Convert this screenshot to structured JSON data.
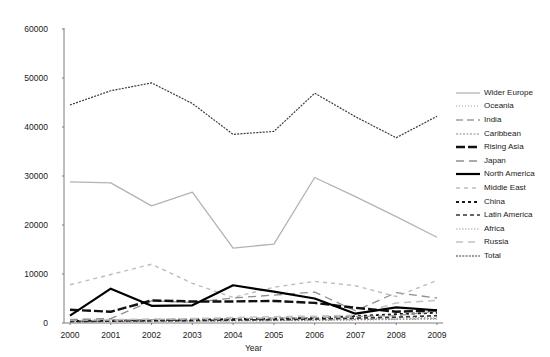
{
  "title": "",
  "axis": {
    "x_title": "Year",
    "y_ticks": [
      "0",
      "10000",
      "20000",
      "30000",
      "40000",
      "50000",
      "60000"
    ],
    "x_ticks": [
      "2000",
      "2001",
      "2002",
      "2003",
      "2004",
      "2005",
      "2006",
      "2007",
      "2008",
      "2009"
    ]
  },
  "legend": {
    "items": [
      {
        "label": "Wider Europe",
        "color": "#b3b3b3",
        "width": 1.3,
        "dash": "none"
      },
      {
        "label": "Oceania",
        "color": "#999999",
        "width": 1.1,
        "dash": "1,2"
      },
      {
        "label": "India",
        "color": "#9e9e9e",
        "width": 1.3,
        "dash": "7,4"
      },
      {
        "label": "Caribbean",
        "color": "#8a8a8a",
        "width": 1.1,
        "dash": "2,1.5"
      },
      {
        "label": "Rising Asia",
        "color": "#111111",
        "width": 2.4,
        "dash": "9,3"
      },
      {
        "label": "Japan",
        "color": "#8f8f8f",
        "width": 1.3,
        "dash": "8,5"
      },
      {
        "label": "North America",
        "color": "#000000",
        "width": 2.2,
        "dash": "none"
      },
      {
        "label": "Middle East",
        "color": "#bdbdbd",
        "width": 1.4,
        "dash": "4,4"
      },
      {
        "label": "China",
        "color": "#1a1a1a",
        "width": 1.9,
        "dash": "3,3"
      },
      {
        "label": "Latin America",
        "color": "#333333",
        "width": 1.7,
        "dash": "4,3"
      },
      {
        "label": "Africa",
        "color": "#a8a8a8",
        "width": 1.1,
        "dash": "1.5,1.5"
      },
      {
        "label": "Russia",
        "color": "#c2c2c2",
        "width": 1.5,
        "dash": "7,5"
      },
      {
        "label": "Total",
        "color": "#3d3d3d",
        "width": 1.2,
        "dash": "2,1.2"
      }
    ]
  },
  "chart_data": {
    "type": "line",
    "title": "",
    "xlabel": "Year",
    "ylabel": "",
    "grid": false,
    "legend_position": "right",
    "xlim": [
      2000,
      2009
    ],
    "ylim": [
      0,
      60000
    ],
    "x": [
      2000,
      2001,
      2002,
      2003,
      2004,
      2005,
      2006,
      2007,
      2008,
      2009
    ],
    "series": [
      {
        "name": "Total",
        "values": [
          44500,
          47400,
          49000,
          44800,
          38500,
          39100,
          46900,
          42100,
          37800,
          42200
        ]
      },
      {
        "name": "Wider Europe",
        "values": [
          28800,
          28600,
          23900,
          26700,
          15300,
          16100,
          29700,
          25800,
          21700,
          17500
        ]
      },
      {
        "name": "North America",
        "values": [
          1500,
          7000,
          3500,
          3600,
          7700,
          6400,
          5000,
          1900,
          3200,
          2600
        ]
      },
      {
        "name": "Middle East",
        "values": [
          7800,
          9900,
          12000,
          8100,
          5200,
          7300,
          8500,
          7600,
          5400,
          8700
        ]
      },
      {
        "name": "Rising Asia",
        "values": [
          2700,
          2300,
          4600,
          4400,
          4400,
          4500,
          4100,
          3100,
          2300,
          2600
        ]
      },
      {
        "name": "Japan",
        "values": [
          700,
          900,
          4500,
          4200,
          5100,
          5700,
          6300,
          2500,
          6200,
          5100
        ]
      },
      {
        "name": "Russia",
        "values": [
          700,
          700,
          800,
          900,
          1100,
          1300,
          1400,
          1600,
          4100,
          4600
        ]
      },
      {
        "name": "India",
        "values": [
          500,
          600,
          700,
          800,
          900,
          1000,
          1100,
          1300,
          1500,
          2400
        ]
      },
      {
        "name": "China",
        "values": [
          400,
          500,
          600,
          700,
          800,
          900,
          1000,
          1400,
          1800,
          2100
        ]
      },
      {
        "name": "Latin America",
        "values": [
          300,
          400,
          450,
          500,
          600,
          700,
          800,
          1000,
          1200,
          1500
        ]
      },
      {
        "name": "Africa",
        "values": [
          350,
          400,
          500,
          550,
          650,
          700,
          800,
          900,
          1000,
          1200
        ]
      },
      {
        "name": "Caribbean",
        "values": [
          250,
          300,
          350,
          400,
          450,
          500,
          600,
          700,
          800,
          900
        ]
      },
      {
        "name": "Oceania",
        "values": [
          200,
          250,
          300,
          350,
          400,
          450,
          500,
          600,
          700,
          800
        ]
      }
    ]
  }
}
